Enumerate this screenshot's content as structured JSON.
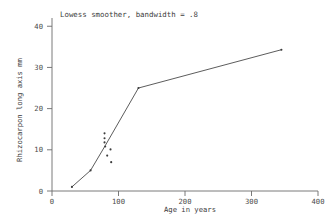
{
  "chart_data": {
    "type": "scatter",
    "title": "Lowess smoother, bandwidth = .8",
    "xlabel": "Age in years",
    "ylabel": "Rhizocarpon long axis mm",
    "xlim": [
      0,
      400
    ],
    "ylim": [
      0,
      42
    ],
    "xticks": [
      0,
      100,
      200,
      300,
      400
    ],
    "xtick_labels": [
      "0",
      "100",
      "200",
      "300",
      "400"
    ],
    "yticks": [
      0,
      10,
      20,
      30,
      40
    ],
    "ytick_labels": [
      "0",
      "10",
      "20",
      "30",
      "40"
    ],
    "grid": false,
    "legend": false,
    "points": [
      {
        "x": 30,
        "y": 1.0
      },
      {
        "x": 58,
        "y": 5.0
      },
      {
        "x": 79,
        "y": 14.0
      },
      {
        "x": 79,
        "y": 12.8
      },
      {
        "x": 79,
        "y": 11.8
      },
      {
        "x": 80,
        "y": 10.8
      },
      {
        "x": 88,
        "y": 10.1
      },
      {
        "x": 83,
        "y": 8.6
      },
      {
        "x": 89,
        "y": 7.0
      },
      {
        "x": 130,
        "y": 25.0
      },
      {
        "x": 345,
        "y": 34.3
      }
    ],
    "series": [
      {
        "name": "lowess",
        "x": [
          30,
          58,
          80,
          130,
          345
        ],
        "values": [
          1.0,
          5.0,
          11.0,
          25.0,
          34.3
        ]
      }
    ]
  },
  "colors": {
    "axis": "#6b6b6b",
    "line": "#4a4a4a",
    "point": "#3c3c3c",
    "text": "#3c3c3c",
    "background": "#ffffff"
  }
}
